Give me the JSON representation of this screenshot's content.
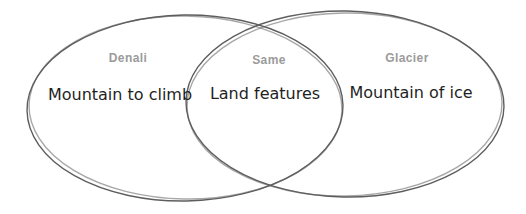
{
  "diagram": {
    "type": "venn",
    "stroke_color": "#5e5e5e",
    "label_color": "#9b9b9b",
    "text_color": "#1f1f1f",
    "left_circle": {
      "label": "Denali",
      "text": "Mountain to climb"
    },
    "intersection": {
      "label": "Same",
      "text": "Land features"
    },
    "right_circle": {
      "label": "Glacier",
      "text": "Mountain of ice"
    }
  }
}
